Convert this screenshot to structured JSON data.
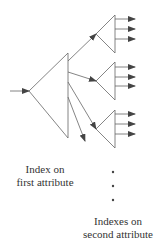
{
  "diagram": {
    "type": "multi-level index tree",
    "labels": {
      "first_index_line1": "Index on",
      "first_index_line2": "first attribute",
      "second_index_line1": "Indexes on",
      "second_index_line2": "second attribute"
    },
    "continuation": "•",
    "colors": {
      "stroke": "#666666",
      "arrowhead": "#444444",
      "text": "#333333"
    },
    "nodes": [
      {
        "id": "first-attribute-index",
        "level": 1
      },
      {
        "id": "second-attribute-index-1",
        "level": 2,
        "outputs": 3
      },
      {
        "id": "second-attribute-index-2",
        "level": 2,
        "outputs": 3
      },
      {
        "id": "second-attribute-index-3",
        "level": 2,
        "outputs": 3
      }
    ]
  }
}
